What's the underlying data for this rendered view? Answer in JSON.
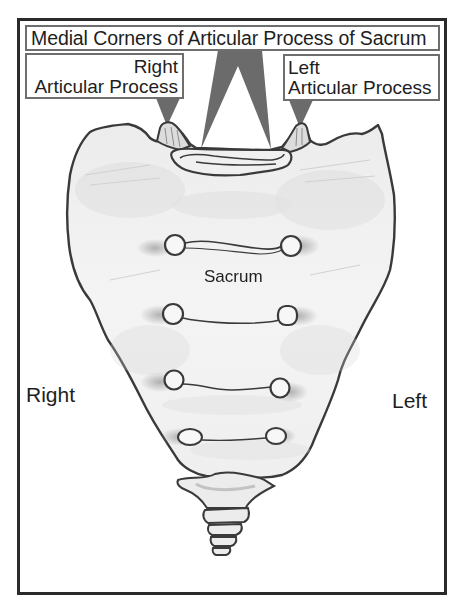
{
  "diagram": {
    "title": "Medial Corners of Articular Process of Sacrum",
    "labels": {
      "right_articular_process": {
        "line1": "Right",
        "line2": "Articular Process"
      },
      "left_articular_process": {
        "line1": "Left",
        "line2": "Articular Process"
      },
      "center": "Sacrum",
      "side_right": "Right",
      "side_left": "Left"
    },
    "colors": {
      "frame": "#2a2a2a",
      "label_border": "#6e6e6e",
      "pointer_fill": "#6b6b6b",
      "bone_outline": "#3a3a3a",
      "bone_fill": "#f2f2f2",
      "shading": "#bdbdbd",
      "text": "#1e1e1e"
    },
    "structures": [
      "sacrum body",
      "sacral promontory / S1 superior surface",
      "right superior articular process",
      "left superior articular process",
      "anterior sacral foramina (4 pairs)",
      "transverse ridges",
      "coccyx"
    ]
  }
}
